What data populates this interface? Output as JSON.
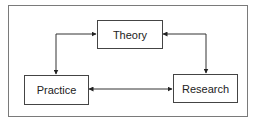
{
  "diagram": {
    "type": "cycle",
    "nodes": [
      {
        "id": "theory",
        "label": "Theory"
      },
      {
        "id": "practice",
        "label": "Practice"
      },
      {
        "id": "research",
        "label": "Research"
      }
    ],
    "edges": [
      {
        "from": "theory",
        "to": "practice",
        "bidirectional": true
      },
      {
        "from": "theory",
        "to": "research",
        "bidirectional": true
      },
      {
        "from": "practice",
        "to": "research",
        "bidirectional": true
      }
    ]
  }
}
